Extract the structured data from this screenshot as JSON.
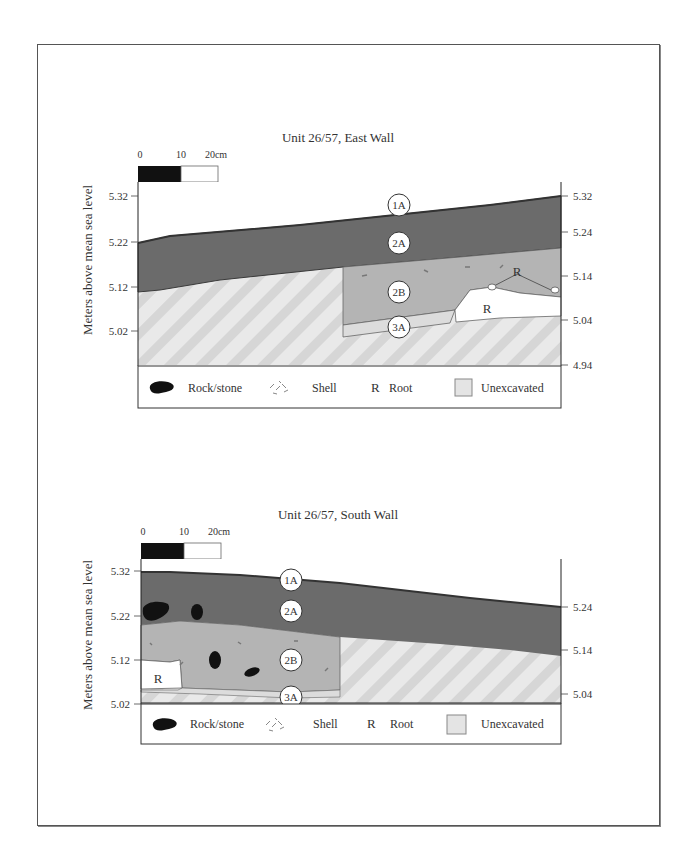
{
  "figures": [
    {
      "title": "Unit 26/57, East Wall",
      "scale_bar": {
        "labels": [
          "0",
          "10",
          "20cm"
        ]
      },
      "y_axis_label": "Meters above mean sea level",
      "left_ticks": [
        "5.32",
        "5.22",
        "5.12",
        "5.02"
      ],
      "right_ticks": [
        "5.32",
        "5.24",
        "5.14",
        "5.04",
        "4.94"
      ],
      "layers": [
        "1A",
        "2A",
        "2B",
        "3A"
      ],
      "root_labels": [
        "R",
        "R"
      ]
    },
    {
      "title": "Unit 26/57, South Wall",
      "scale_bar": {
        "labels": [
          "0",
          "10",
          "20cm"
        ]
      },
      "y_axis_label": "Meters above mean sea level",
      "left_ticks": [
        "5.32",
        "5.22",
        "5.12",
        "5.02"
      ],
      "right_ticks": [
        "5.24",
        "5.14",
        "5.04"
      ],
      "layers": [
        "1A",
        "2A",
        "2B",
        "3A"
      ],
      "root_labels": [
        "R"
      ]
    }
  ],
  "legend": {
    "rock": "Rock/stone",
    "shell": "Shell",
    "root_symbol": "R",
    "root": "Root",
    "unexcavated": "Unexcavated"
  },
  "colors": {
    "layer_2A": "#6b6b6b",
    "layer_2B": "#b4b4b4",
    "layer_3A": "#dcdcdc",
    "unexcavated": "#e6e6e6",
    "rock": "#111111"
  }
}
